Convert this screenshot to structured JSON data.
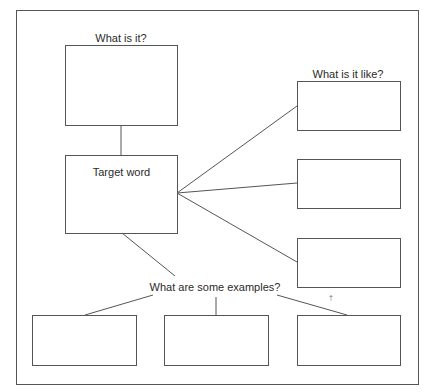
{
  "diagram": {
    "type": "concept-map / word map graphic organizer",
    "nodes": {
      "what_is_it": {
        "label": "What is it?",
        "text": ""
      },
      "target_word": {
        "label": "",
        "text": "Target word"
      },
      "what_is_it_like": {
        "label": "What is it like?",
        "boxes": [
          {
            "text": ""
          },
          {
            "text": ""
          },
          {
            "text": ""
          }
        ]
      },
      "examples": {
        "label": "What are some examples?",
        "boxes": [
          {
            "text": ""
          },
          {
            "text": ""
          },
          {
            "text": ""
          }
        ]
      }
    },
    "edges": [
      {
        "from": "what_is_it",
        "to": "target_word"
      },
      {
        "from": "target_word",
        "to": "what_is_it_like.boxes.0"
      },
      {
        "from": "target_word",
        "to": "what_is_it_like.boxes.1"
      },
      {
        "from": "target_word",
        "to": "what_is_it_like.boxes.2"
      },
      {
        "from": "target_word",
        "to": "examples"
      },
      {
        "from": "examples",
        "to": "examples.boxes.0"
      },
      {
        "from": "examples",
        "to": "examples.boxes.1"
      },
      {
        "from": "examples",
        "to": "examples.boxes.2"
      }
    ],
    "marks": {
      "dagger": "†"
    },
    "colors": {
      "stroke": "#555555",
      "text": "#2a2a2a",
      "background": "#ffffff"
    }
  }
}
